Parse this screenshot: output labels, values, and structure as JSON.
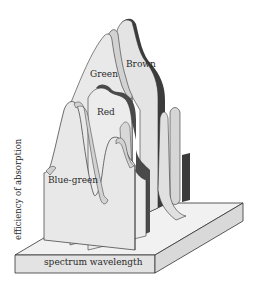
{
  "diagram": {
    "type": "3d-absorption-spectra",
    "y_axis_label": "efficiency of absorption",
    "x_axis_label": "spectrum wavelength",
    "series": [
      {
        "name": "Blue-green",
        "order": 1,
        "shade": "#e6e6e6",
        "edge": "#cfcfcf"
      },
      {
        "name": "Red",
        "order": 2,
        "shade": "#ececec",
        "edge": "#4a4a4a"
      },
      {
        "name": "Green",
        "order": 3,
        "shade": "#e9e9e9",
        "edge": "#c9c9c9"
      },
      {
        "name": "Brown",
        "order": 4,
        "shade": "#e4e4e4",
        "edge": "#3c3c3c"
      }
    ],
    "colors": {
      "background": "#ffffff",
      "panel_light": "#ebebeb",
      "panel_mid": "#d6d6d6",
      "dark_edge": "#3a3a3a",
      "base_top": "#f0f0f0",
      "base_front": "#e2e2e2",
      "outline": "#333333"
    }
  }
}
